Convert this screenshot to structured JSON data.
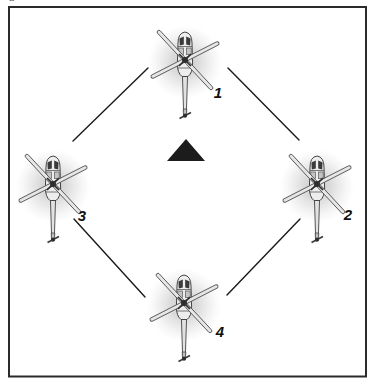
{
  "figure": {
    "corner_mark": "a",
    "bg_color": "#ffffff",
    "frame_color": "#2b2b2b"
  },
  "diagram": {
    "link_color": "#1a1a1a",
    "label_color": "#111111",
    "center_marker": {
      "shape": "triangle-up",
      "color": "#1c1c1c",
      "cx": 186,
      "cy": 150,
      "width": 38,
      "height": 22
    },
    "helicopters": [
      {
        "label": "1",
        "hub_x": 185,
        "hub_y": 60,
        "label_x": 218,
        "label_y": 92
      },
      {
        "label": "2",
        "hub_x": 317,
        "hub_y": 184,
        "label_x": 348,
        "label_y": 214
      },
      {
        "label": "3",
        "hub_x": 53,
        "hub_y": 184,
        "label_x": 82,
        "label_y": 215
      },
      {
        "label": "4",
        "hub_x": 184,
        "hub_y": 303,
        "label_x": 220,
        "label_y": 331
      }
    ],
    "links": [
      {
        "from": "3",
        "to": "1",
        "x1": 73,
        "y1": 141,
        "x2": 148,
        "y2": 68
      },
      {
        "from": "1",
        "to": "2",
        "x1": 228,
        "y1": 68,
        "x2": 299,
        "y2": 140
      },
      {
        "from": "3",
        "to": "4",
        "x1": 74,
        "y1": 219,
        "x2": 145,
        "y2": 297
      },
      {
        "from": "4",
        "to": "2",
        "x1": 227,
        "y1": 295,
        "x2": 300,
        "y2": 219
      }
    ]
  }
}
